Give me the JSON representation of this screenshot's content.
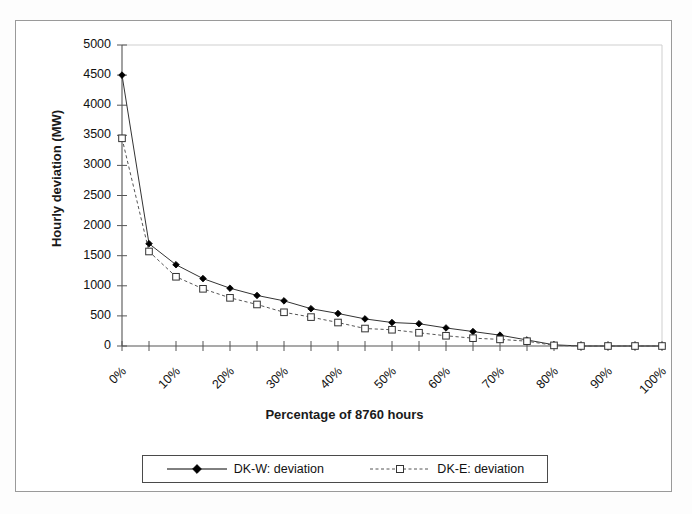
{
  "chart_data": {
    "type": "line",
    "title": "",
    "xlabel": "Percentage of 8760 hours",
    "ylabel": "Hourly deviation (MW)",
    "x": [
      0,
      5,
      10,
      15,
      20,
      25,
      30,
      35,
      40,
      45,
      50,
      55,
      60,
      65,
      70,
      75,
      80,
      85,
      90,
      95,
      100
    ],
    "xtick_labels": [
      "0%",
      "10%",
      "20%",
      "30%",
      "40%",
      "50%",
      "60%",
      "70%",
      "80%",
      "90%",
      "100%"
    ],
    "xtick_values": [
      0,
      10,
      20,
      30,
      40,
      50,
      60,
      70,
      80,
      90,
      100
    ],
    "ytick_labels": [
      "0",
      "500",
      "1000",
      "1500",
      "2000",
      "2500",
      "3000",
      "3500",
      "4000",
      "4500",
      "5000"
    ],
    "ytick_values": [
      0,
      500,
      1000,
      1500,
      2000,
      2500,
      3000,
      3500,
      4000,
      4500,
      5000
    ],
    "xlim": [
      0,
      100
    ],
    "ylim": [
      0,
      5000
    ],
    "grid": false,
    "legend_position": "bottom",
    "series": [
      {
        "name": "DK-W: deviation",
        "style": "solid",
        "marker": "filled-diamond",
        "color": "#000000",
        "values": [
          4500,
          1700,
          1350,
          1120,
          960,
          840,
          750,
          620,
          540,
          450,
          390,
          370,
          300,
          240,
          180,
          100,
          20,
          0,
          0,
          0,
          0
        ]
      },
      {
        "name": "DK-E: deviation",
        "style": "dashed",
        "marker": "open-square",
        "color": "#000000",
        "values": [
          3450,
          1570,
          1150,
          950,
          800,
          690,
          560,
          480,
          390,
          290,
          270,
          220,
          170,
          130,
          110,
          80,
          10,
          0,
          0,
          0,
          0
        ]
      }
    ]
  },
  "legend": {
    "entries": [
      {
        "label": "DK-W: deviation"
      },
      {
        "label": "DK-E: deviation"
      }
    ]
  }
}
